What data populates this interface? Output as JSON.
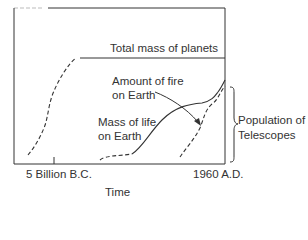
{
  "diagram": {
    "x_axis": {
      "label": "Time",
      "ticks": [
        "5 Billion B.C.",
        "1960 A.D."
      ]
    },
    "curves": {
      "planets": "Total mass of planets",
      "fire_line1": "Amount of fire",
      "fire_line2": "on Earth",
      "life_line1": "Mass of life",
      "life_line2": "on Earth"
    },
    "bracket": {
      "line1": "Population of",
      "line2": "Telescopes"
    },
    "colors": {
      "line": "#2a2a2a",
      "background": "#ffffff"
    }
  }
}
